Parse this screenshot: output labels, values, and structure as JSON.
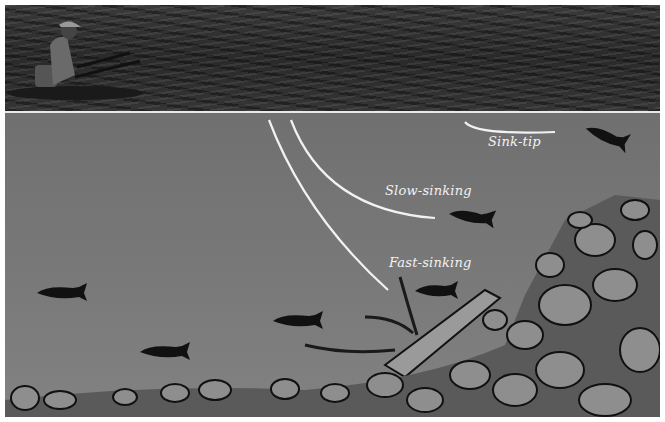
{
  "figure": {
    "scene": {
      "top_photo": "Angler in float tube on lake surface",
      "underwater": "Trout at various depths, sunken branches, rocky lake bed"
    },
    "labels": {
      "sink_tip": "Sink-tip",
      "slow_sinking": "Slow-sinking",
      "fast_sinking": "Fast-sinking"
    },
    "colors": {
      "water": "#707070",
      "line": "#f2f2f2",
      "fish": "#111111",
      "rock": "#8a8a8a",
      "surface_photo": "#2e2e2e"
    }
  }
}
